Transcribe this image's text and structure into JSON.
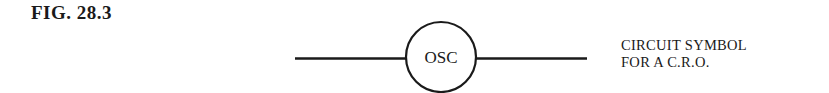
{
  "figure": {
    "label": "FIG. 28.3",
    "symbol_text": "OSC",
    "caption_lines": [
      "CIRCUIT SYMBOL",
      "FOR A C.R.O."
    ],
    "stroke_color": "#1a1a1a"
  }
}
